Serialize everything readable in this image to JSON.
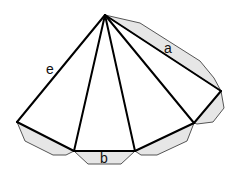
{
  "colors": {
    "edge": "#000000",
    "flap_fill": "#e6e6e6",
    "flap_stroke": "#555555",
    "background": "#ffffff"
  },
  "labels": {
    "a": "a",
    "b": "b",
    "e": "e"
  }
}
